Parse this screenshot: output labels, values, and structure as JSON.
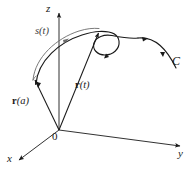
{
  "figure": {
    "type": "math-diagram",
    "background_color": "#ffffff",
    "stroke_color": "#1a1a1a",
    "arc_stroke_color": "#6b6b6b",
    "axes": [
      {
        "id": "z",
        "label": "z",
        "direction": "up"
      },
      {
        "id": "y",
        "label": "y",
        "direction": "right"
      },
      {
        "id": "x",
        "label": "x",
        "direction": "down-left"
      }
    ],
    "origin": {
      "label": "0"
    },
    "curve": {
      "label": "C",
      "has_loop": true,
      "direction_arrows": 3
    },
    "arc_length": {
      "label_name": "s",
      "label_arg": "(t)",
      "label": "s(t)"
    },
    "vectors": [
      {
        "id": "r-a",
        "name": "r",
        "arg": "(a)",
        "label": "r(a)"
      },
      {
        "id": "r-t",
        "name": "r",
        "arg": "(t)",
        "label": "r(t)"
      }
    ]
  }
}
